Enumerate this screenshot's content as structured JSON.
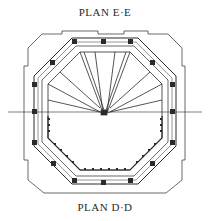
{
  "diagram": {
    "top_label": "PLAN E·E",
    "bottom_label": "PLAN D·D",
    "type": "architectural octagonal floor plan",
    "ink_color": "#2a2a2a",
    "background": "#ffffff"
  }
}
